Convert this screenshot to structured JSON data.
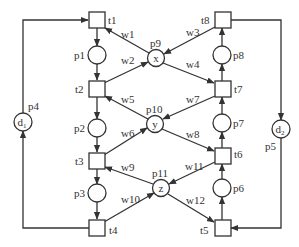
{
  "diagram": {
    "type": "petri-net",
    "transitions": [
      {
        "id": "t1",
        "label": "t1",
        "x": 89,
        "y": 12
      },
      {
        "id": "t2",
        "label": "t2",
        "x": 89,
        "y": 81
      },
      {
        "id": "t3",
        "label": "t3",
        "x": 89,
        "y": 153
      },
      {
        "id": "t4",
        "label": "t4",
        "x": 89,
        "y": 220
      },
      {
        "id": "t5",
        "label": "t5",
        "x": 215,
        "y": 220
      },
      {
        "id": "t6",
        "label": "t6",
        "x": 215,
        "y": 148
      },
      {
        "id": "t7",
        "label": "t7",
        "x": 215,
        "y": 81
      },
      {
        "id": "t8",
        "label": "t8",
        "x": 215,
        "y": 12
      }
    ],
    "places": [
      {
        "id": "p1",
        "label": "p1",
        "inner": "",
        "cx": 97,
        "cy": 55
      },
      {
        "id": "p2",
        "label": "p2",
        "inner": "",
        "cx": 97,
        "cy": 128
      },
      {
        "id": "p3",
        "label": "p3",
        "inner": "",
        "cx": 97,
        "cy": 193
      },
      {
        "id": "p4",
        "label": "p4",
        "inner": "d1",
        "cx": 23,
        "cy": 122
      },
      {
        "id": "p5",
        "label": "p5",
        "inner": "d2",
        "cx": 281,
        "cy": 129
      },
      {
        "id": "p6",
        "label": "p6",
        "inner": "",
        "cx": 222,
        "cy": 188
      },
      {
        "id": "p7",
        "label": "p7",
        "inner": "",
        "cx": 222,
        "cy": 123
      },
      {
        "id": "p8",
        "label": "p8",
        "inner": "",
        "cx": 222,
        "cy": 55
      },
      {
        "id": "p9",
        "label": "p9",
        "inner": "x",
        "cx": 156,
        "cy": 58
      },
      {
        "id": "p10",
        "label": "p10",
        "inner": "y",
        "cx": 155,
        "cy": 124
      },
      {
        "id": "p11",
        "label": "p11",
        "inner": "z",
        "cx": 161,
        "cy": 188
      }
    ],
    "weights": [
      "w1",
      "w2",
      "w3",
      "w4",
      "w5",
      "w6",
      "w7",
      "w8",
      "w9",
      "w10",
      "w11",
      "w12"
    ],
    "colors": {
      "stroke": "#333333",
      "background": "#ffffff"
    }
  }
}
